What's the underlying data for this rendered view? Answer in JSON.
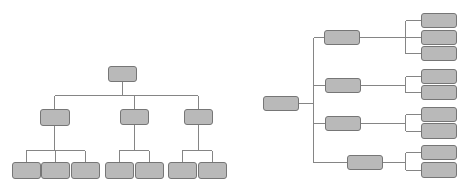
{
  "diagram": {
    "type": "two hierarchy tree diagrams (no text labels)",
    "style": {
      "box_fill": "#b9b9b9",
      "box_stroke": "#767676",
      "line_color": "#858585",
      "background": "#ffffff"
    },
    "vertical_tree": {
      "orientation": "top-down",
      "root": {
        "x": 108,
        "y": 66,
        "w": 28,
        "h": 15
      },
      "children": [
        {
          "box": {
            "x": 40,
            "y": 109,
            "w": 29,
            "h": 16
          },
          "leaves": [
            {
              "x": 12,
              "y": 162,
              "w": 28,
              "h": 16
            },
            {
              "x": 41,
              "y": 162,
              "w": 28,
              "h": 16
            },
            {
              "x": 71,
              "y": 162,
              "w": 28,
              "h": 16
            }
          ]
        },
        {
          "box": {
            "x": 120,
            "y": 109,
            "w": 28,
            "h": 15
          },
          "leaves": [
            {
              "x": 105,
              "y": 162,
              "w": 28,
              "h": 16
            },
            {
              "x": 135,
              "y": 162,
              "w": 28,
              "h": 16
            }
          ]
        },
        {
          "box": {
            "x": 184,
            "y": 109,
            "w": 28,
            "h": 15
          },
          "leaves": [
            {
              "x": 168,
              "y": 162,
              "w": 28,
              "h": 16
            },
            {
              "x": 198,
              "y": 162,
              "w": 28,
              "h": 16
            }
          ]
        }
      ]
    },
    "horizontal_tree": {
      "orientation": "left-right",
      "root": {
        "x": 263,
        "y": 96,
        "w": 35,
        "h": 14
      },
      "trunk_x": 313,
      "children": [
        {
          "box": {
            "x": 324,
            "y": 30,
            "w": 35,
            "h": 14
          },
          "leaves": [
            {
              "x": 421,
              "y": 13,
              "w": 35,
              "h": 14
            },
            {
              "x": 421,
              "y": 30,
              "w": 35,
              "h": 14
            },
            {
              "x": 421,
              "y": 46,
              "w": 35,
              "h": 14
            }
          ]
        },
        {
          "box": {
            "x": 325,
            "y": 78,
            "w": 35,
            "h": 14
          },
          "leaves": [
            {
              "x": 421,
              "y": 69,
              "w": 35,
              "h": 14
            },
            {
              "x": 421,
              "y": 85,
              "w": 35,
              "h": 14
            }
          ]
        },
        {
          "box": {
            "x": 325,
            "y": 116,
            "w": 35,
            "h": 14
          },
          "leaves": [
            {
              "x": 421,
              "y": 107,
              "w": 35,
              "h": 14
            },
            {
              "x": 421,
              "y": 123,
              "w": 35,
              "h": 15
            }
          ]
        },
        {
          "box": {
            "x": 347,
            "y": 155,
            "w": 35,
            "h": 14
          },
          "leaves": [
            {
              "x": 421,
              "y": 145,
              "w": 35,
              "h": 14
            },
            {
              "x": 421,
              "y": 162,
              "w": 35,
              "h": 15
            }
          ]
        }
      ]
    }
  }
}
